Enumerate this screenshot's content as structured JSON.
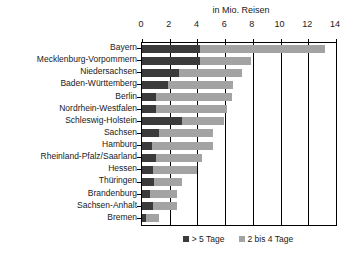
{
  "chart_data": {
    "type": "bar",
    "orientation": "horizontal",
    "stacked": true,
    "title": "in Mio. Reisen",
    "xlabel": "in Mio. Reisen",
    "ylabel": "",
    "xlim": [
      0,
      14
    ],
    "xticks": [
      0,
      2,
      4,
      6,
      8,
      10,
      12,
      14
    ],
    "xtick_labels": [
      "0",
      "2",
      "4",
      "6",
      "8",
      "10",
      "12",
      "14"
    ],
    "grid": true,
    "legend_position": "bottom",
    "categories": [
      "Bayern",
      "Mecklenburg-Vorpommern",
      "Niedersachsen",
      "Baden-Württemberg",
      "Berlin",
      "Nordrhein-Westfalen",
      "Schleswig-Holstein",
      "Sachsen",
      "Hamburg",
      "Rheinland-Pfalz/Saarland",
      "Hessen",
      "Thüringen",
      "Brandenburg",
      "Sachsen-Anhalt",
      "Bremen"
    ],
    "series": [
      {
        "name": "> 5 Tage",
        "color": "#3b3b3b",
        "values": [
          4.2,
          4.2,
          2.7,
          1.9,
          1.0,
          1.0,
          2.9,
          1.2,
          0.7,
          1.0,
          0.8,
          0.9,
          0.6,
          0.8,
          0.3
        ]
      },
      {
        "name": "2 bis 4 Tage",
        "color": "#a3a3a3",
        "values": [
          9.0,
          3.7,
          4.5,
          4.7,
          5.5,
          5.1,
          3.0,
          3.9,
          4.4,
          3.3,
          3.2,
          2.0,
          1.9,
          1.7,
          0.9
        ]
      }
    ],
    "totals": [
      13.2,
      7.9,
      7.2,
      6.6,
      6.5,
      6.1,
      5.9,
      5.1,
      5.1,
      4.3,
      4.0,
      2.9,
      2.5,
      2.5,
      1.2
    ]
  },
  "legend": {
    "items": [
      {
        "label": "> 5 Tage",
        "color": "#3b3b3b"
      },
      {
        "label": "2 bis 4 Tage",
        "color": "#a3a3a3"
      }
    ]
  },
  "colors": {
    "dark": "#3b3b3b",
    "light": "#a3a3a3",
    "axis": "#000000",
    "text": "#1a1a1a",
    "background": "#ffffff"
  }
}
